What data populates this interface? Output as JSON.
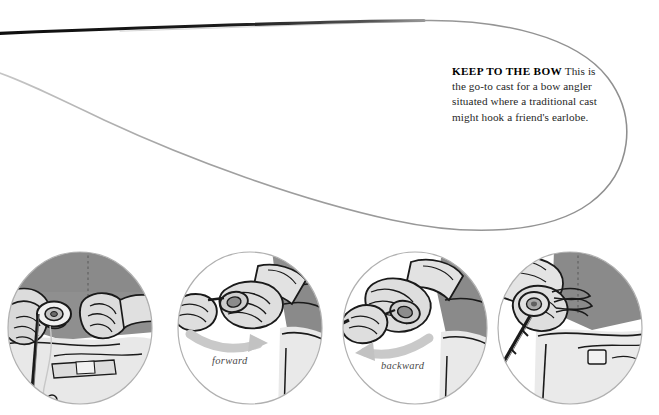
{
  "page": {
    "background_color": "#ffffff",
    "width": 659,
    "height": 415
  },
  "illustration": {
    "name": "bow-and-arrow-cast-line-loop",
    "rod_line_color": "#111111",
    "fly_line_color": "#9a9a9a",
    "description": "fly rod tip with a long narrow loop of fly line extending to the right"
  },
  "caption": {
    "lead": "KEEP TO THE BOW",
    "body": " This is the go-to cast for a bow angler situated where a traditional cast might hook a friend's earlobe.",
    "full_text": "KEEP TO THE BOW This is the go-to cast for a bow angler situated where a traditional cast might hook a friend's earlobe."
  },
  "panels": [
    {
      "id": "panel-1",
      "name": "panel-grip-setup",
      "label": "",
      "description": "Two hands gripping the rod and drawing the line back, angler wearing a grey shirt"
    },
    {
      "id": "panel-2",
      "name": "panel-forward-stroke",
      "label": "forward",
      "description": "Hand pushing the rod forward, motion arrow sweeping right"
    },
    {
      "id": "panel-3",
      "name": "panel-backward-stroke",
      "label": "backward",
      "description": "Hand pulling the rod backward, motion arrow sweeping left"
    },
    {
      "id": "panel-4",
      "name": "panel-release",
      "label": "",
      "description": "Hand releasing the line with the rod angled down"
    }
  ],
  "colors": {
    "shirt_dark_grey": "#8a8a8a",
    "skin_light_grey": "#d6d6d6",
    "mid_grey": "#b5b5b5",
    "outline_black": "#1a1a1a",
    "circle_border": "#b0b0b0",
    "arrow_grey": "#c9c9c9"
  }
}
